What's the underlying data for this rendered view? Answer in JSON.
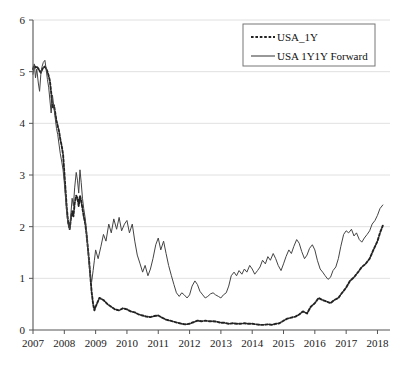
{
  "chart_data": {
    "type": "line",
    "title": "",
    "subtitle": "",
    "xlabel": "",
    "ylabel": "",
    "xlim": [
      2007,
      2018.4
    ],
    "ylim": [
      0,
      6
    ],
    "grid": "horizontal",
    "legend_position": "top-right",
    "x_ticks": [
      "2007",
      "2008",
      "2009",
      "2010",
      "2011",
      "2012",
      "2013",
      "2014",
      "2015",
      "2016",
      "2017",
      "2018"
    ],
    "x_tick_values": [
      2007,
      2008,
      2009,
      2010,
      2011,
      2012,
      2013,
      2014,
      2015,
      2016,
      2017,
      2018
    ],
    "y_ticks": [
      "0",
      "1",
      "2",
      "3",
      "4",
      "5",
      "6"
    ],
    "y_tick_values": [
      0,
      1,
      2,
      3,
      4,
      5,
      6
    ],
    "series": [
      {
        "name": "USA_1Y",
        "style": "dashed",
        "color": "#222222",
        "x": [
          2007.0,
          2007.04,
          2007.08,
          2007.12,
          2007.17,
          2007.21,
          2007.25,
          2007.29,
          2007.33,
          2007.38,
          2007.42,
          2007.46,
          2007.5,
          2007.54,
          2007.58,
          2007.62,
          2007.67,
          2007.71,
          2007.75,
          2007.79,
          2007.83,
          2007.87,
          2007.92,
          2007.96,
          2008.0,
          2008.04,
          2008.08,
          2008.12,
          2008.17,
          2008.21,
          2008.25,
          2008.29,
          2008.33,
          2008.38,
          2008.42,
          2008.46,
          2008.5,
          2008.54,
          2008.58,
          2008.62,
          2008.67,
          2008.71,
          2008.75,
          2008.79,
          2008.83,
          2008.87,
          2008.92,
          2008.96,
          2009.0,
          2009.12,
          2009.25,
          2009.38,
          2009.5,
          2009.62,
          2009.75,
          2009.87,
          2010.0,
          2010.12,
          2010.25,
          2010.38,
          2010.5,
          2010.62,
          2010.75,
          2010.87,
          2011.0,
          2011.12,
          2011.25,
          2011.38,
          2011.5,
          2011.62,
          2011.75,
          2011.87,
          2012.0,
          2012.12,
          2012.25,
          2012.38,
          2012.5,
          2012.62,
          2012.75,
          2012.87,
          2013.0,
          2013.12,
          2013.25,
          2013.38,
          2013.5,
          2013.62,
          2013.75,
          2013.87,
          2014.0,
          2014.12,
          2014.25,
          2014.38,
          2014.5,
          2014.62,
          2014.75,
          2014.87,
          2015.0,
          2015.12,
          2015.25,
          2015.38,
          2015.5,
          2015.62,
          2015.75,
          2015.87,
          2016.0,
          2016.12,
          2016.25,
          2016.38,
          2016.5,
          2016.62,
          2016.75,
          2016.87,
          2017.0,
          2017.12,
          2017.25,
          2017.38,
          2017.5,
          2017.62,
          2017.75,
          2017.87,
          2018.0,
          2018.08,
          2018.17
        ],
        "values": [
          5.05,
          5.12,
          5.08,
          5.1,
          5.06,
          5.02,
          4.98,
          5.04,
          5.08,
          5.1,
          5.06,
          5.0,
          4.92,
          4.82,
          4.6,
          4.3,
          4.35,
          4.2,
          4.05,
          3.95,
          3.85,
          3.7,
          3.55,
          3.4,
          3.05,
          2.7,
          2.35,
          2.1,
          1.95,
          2.15,
          2.3,
          2.2,
          2.45,
          2.6,
          2.55,
          2.4,
          2.6,
          2.5,
          2.35,
          2.2,
          2.05,
          1.85,
          1.6,
          1.35,
          1.05,
          0.75,
          0.5,
          0.38,
          0.45,
          0.62,
          0.58,
          0.5,
          0.45,
          0.4,
          0.38,
          0.42,
          0.4,
          0.36,
          0.34,
          0.3,
          0.28,
          0.26,
          0.25,
          0.27,
          0.28,
          0.24,
          0.2,
          0.18,
          0.16,
          0.14,
          0.12,
          0.11,
          0.12,
          0.15,
          0.18,
          0.17,
          0.18,
          0.17,
          0.17,
          0.16,
          0.14,
          0.14,
          0.12,
          0.13,
          0.12,
          0.12,
          0.13,
          0.12,
          0.12,
          0.11,
          0.1,
          0.1,
          0.11,
          0.1,
          0.12,
          0.13,
          0.18,
          0.22,
          0.24,
          0.26,
          0.3,
          0.36,
          0.32,
          0.45,
          0.52,
          0.62,
          0.58,
          0.55,
          0.52,
          0.58,
          0.62,
          0.72,
          0.82,
          0.95,
          1.02,
          1.12,
          1.22,
          1.28,
          1.38,
          1.55,
          1.72,
          1.88,
          2.02
        ]
      },
      {
        "name": "USA 1Y1Y Forward",
        "style": "solid",
        "color": "#444444",
        "x": [
          2007.0,
          2007.04,
          2007.08,
          2007.12,
          2007.17,
          2007.21,
          2007.25,
          2007.29,
          2007.33,
          2007.38,
          2007.42,
          2007.46,
          2007.5,
          2007.54,
          2007.58,
          2007.62,
          2007.67,
          2007.71,
          2007.75,
          2007.79,
          2007.83,
          2007.87,
          2007.92,
          2007.96,
          2008.0,
          2008.04,
          2008.08,
          2008.12,
          2008.17,
          2008.21,
          2008.25,
          2008.29,
          2008.33,
          2008.38,
          2008.42,
          2008.46,
          2008.5,
          2008.54,
          2008.58,
          2008.62,
          2008.67,
          2008.71,
          2008.75,
          2008.79,
          2008.83,
          2008.87,
          2008.92,
          2008.96,
          2009.0,
          2009.08,
          2009.17,
          2009.25,
          2009.33,
          2009.42,
          2009.5,
          2009.58,
          2009.67,
          2009.75,
          2009.83,
          2009.92,
          2010.0,
          2010.08,
          2010.17,
          2010.25,
          2010.33,
          2010.42,
          2010.5,
          2010.58,
          2010.67,
          2010.75,
          2010.83,
          2010.92,
          2011.0,
          2011.08,
          2011.17,
          2011.25,
          2011.33,
          2011.42,
          2011.5,
          2011.58,
          2011.67,
          2011.75,
          2011.83,
          2011.92,
          2012.0,
          2012.08,
          2012.17,
          2012.25,
          2012.33,
          2012.42,
          2012.5,
          2012.58,
          2012.67,
          2012.75,
          2012.83,
          2012.92,
          2013.0,
          2013.08,
          2013.17,
          2013.25,
          2013.33,
          2013.42,
          2013.5,
          2013.58,
          2013.67,
          2013.75,
          2013.83,
          2013.92,
          2014.0,
          2014.08,
          2014.17,
          2014.25,
          2014.33,
          2014.42,
          2014.5,
          2014.58,
          2014.67,
          2014.75,
          2014.83,
          2014.92,
          2015.0,
          2015.08,
          2015.17,
          2015.25,
          2015.33,
          2015.42,
          2015.5,
          2015.58,
          2015.67,
          2015.75,
          2015.83,
          2015.92,
          2016.0,
          2016.08,
          2016.17,
          2016.25,
          2016.33,
          2016.42,
          2016.5,
          2016.58,
          2016.67,
          2016.75,
          2016.83,
          2016.92,
          2017.0,
          2017.08,
          2017.17,
          2017.25,
          2017.33,
          2017.42,
          2017.5,
          2017.58,
          2017.67,
          2017.75,
          2017.83,
          2017.92,
          2018.0,
          2018.08,
          2018.17
        ],
        "values": [
          4.95,
          5.15,
          4.88,
          5.05,
          4.78,
          4.62,
          4.95,
          5.1,
          5.18,
          5.22,
          5.05,
          4.85,
          4.7,
          4.45,
          4.2,
          4.55,
          4.3,
          4.1,
          3.9,
          3.78,
          3.6,
          3.42,
          3.25,
          3.1,
          2.85,
          2.55,
          2.25,
          2.05,
          1.95,
          2.25,
          2.55,
          2.4,
          2.75,
          3.05,
          2.9,
          2.65,
          3.1,
          2.85,
          2.55,
          2.35,
          2.15,
          1.9,
          1.6,
          1.3,
          1.05,
          0.92,
          1.15,
          1.35,
          1.55,
          1.38,
          1.62,
          1.85,
          1.72,
          2.05,
          1.88,
          2.15,
          1.95,
          2.18,
          1.92,
          2.05,
          2.12,
          1.88,
          2.05,
          1.72,
          1.45,
          1.28,
          1.12,
          1.25,
          1.05,
          1.18,
          1.38,
          1.65,
          1.78,
          1.55,
          1.72,
          1.48,
          1.25,
          1.05,
          0.88,
          0.72,
          0.65,
          0.72,
          0.68,
          0.62,
          0.68,
          0.85,
          0.95,
          0.88,
          0.75,
          0.68,
          0.62,
          0.65,
          0.7,
          0.72,
          0.68,
          0.65,
          0.62,
          0.68,
          0.72,
          0.85,
          1.05,
          1.12,
          1.05,
          1.15,
          1.08,
          1.18,
          1.12,
          1.25,
          1.18,
          1.08,
          1.15,
          1.22,
          1.35,
          1.28,
          1.42,
          1.35,
          1.48,
          1.38,
          1.25,
          1.15,
          1.28,
          1.42,
          1.55,
          1.48,
          1.62,
          1.75,
          1.68,
          1.52,
          1.38,
          1.45,
          1.58,
          1.65,
          1.55,
          1.35,
          1.18,
          1.12,
          1.05,
          0.98,
          1.02,
          1.15,
          1.22,
          1.38,
          1.62,
          1.85,
          1.92,
          1.88,
          1.95,
          1.82,
          1.88,
          1.75,
          1.7,
          1.78,
          1.85,
          1.92,
          2.05,
          2.12,
          2.22,
          2.35,
          2.42
        ]
      }
    ]
  },
  "legend": {
    "entries": [
      {
        "label": "USA_1Y",
        "style": "dashed"
      },
      {
        "label": "USA 1Y1Y Forward",
        "style": "solid"
      }
    ]
  }
}
